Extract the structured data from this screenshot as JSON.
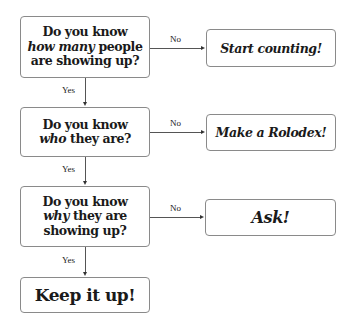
{
  "flowchart": {
    "questions": [
      {
        "line1": "Do you know",
        "emph": "how many",
        "rest": " people",
        "line3": "are showing up?"
      },
      {
        "line1": "Do you know",
        "emph": "who",
        "rest": " they are?",
        "line3": ""
      },
      {
        "line1": "Do you know",
        "emph": "why",
        "rest": " they are",
        "line3": "showing up?"
      }
    ],
    "no_outcomes": [
      "Start counting!",
      "Make a Rolodex!",
      "Ask!"
    ],
    "final": "Keep it up!",
    "labels": {
      "yes": "Yes",
      "no": "No"
    }
  }
}
